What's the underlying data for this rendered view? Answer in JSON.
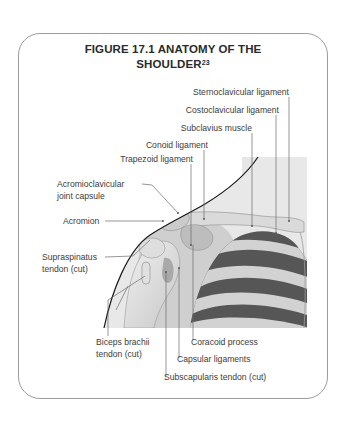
{
  "figure": {
    "title_line1": "FIGURE 17.1 ANATOMY OF THE",
    "title_line2": "SHOULDER",
    "title_superscript": "23"
  },
  "labels": {
    "sternoclavicular_ligament": "Sternoclavicular ligament",
    "costoclavicular_ligament": "Costoclavicular ligament",
    "subclavius_muscle": "Subclavius muscle",
    "conoid_ligament": "Conoid ligament",
    "trapezoid_ligament": "Trapezoid ligament",
    "acromioclavicular_line1": "Acromioclavicular",
    "acromioclavicular_line2": "joint capsule",
    "acromion": "Acromion",
    "supraspinatus_line1": "Supraspinatus",
    "supraspinatus_line2": "tendon (cut)",
    "biceps_line1": "Biceps brachii",
    "biceps_line2": "tendon (cut)",
    "coracoid_process": "Coracoid process",
    "capsular_ligaments": "Capsular ligaments",
    "subscapularis_tendon": "Subscapularis tendon (cut)"
  },
  "colors": {
    "frame_border": "#9c9c9c",
    "illustration_bg": "#e6e6e6",
    "rib_light": "#d2d2d2",
    "intercostal_dark": "#565656",
    "body_outline": "#1a1a1a",
    "leader_line": "#6a6a6a"
  }
}
